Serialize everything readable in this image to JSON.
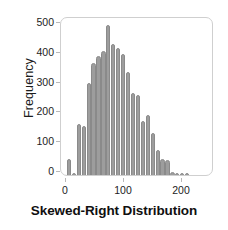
{
  "chart_data": {
    "type": "bar",
    "subtype": "histogram",
    "title": "Skewed-Right Distribution",
    "xlabel": "",
    "ylabel": "Frequency",
    "xlim": [
      -5,
      232
    ],
    "ylim": [
      0,
      520
    ],
    "grid": false,
    "legend": null,
    "bar_color": "#9d9d9d",
    "bar_edge_color": "#8a8a8a",
    "bin_width": 8.5,
    "xticks": [
      0,
      100,
      200
    ],
    "xtick_labels": [
      "0",
      "100",
      "200"
    ],
    "yticks": [
      0,
      100,
      200,
      300,
      400,
      500
    ],
    "ytick_labels": [
      "0",
      "100",
      "200",
      "300",
      "400",
      "500"
    ],
    "bin_centers": [
      5,
      13.5,
      22,
      30.5,
      39,
      47.5,
      56,
      64.5,
      73,
      81.5,
      90,
      98.5,
      107,
      115.5,
      124,
      132.5,
      141,
      149.5,
      158,
      166.5,
      175,
      183.5,
      192,
      200.5,
      209,
      217.5,
      226
    ],
    "values": [
      55,
      5,
      170,
      165,
      310,
      375,
      400,
      415,
      505,
      440,
      425,
      405,
      345,
      275,
      270,
      180,
      200,
      140,
      85,
      55,
      50,
      10,
      8,
      8,
      8,
      0,
      0
    ]
  },
  "axes": {
    "y_title": "Frequency"
  },
  "title": {
    "text": "Skewed-Right Distribution"
  }
}
